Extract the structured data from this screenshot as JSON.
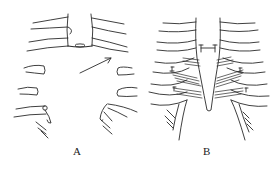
{
  "figure": {
    "panels": [
      {
        "label": "A",
        "content": "Divided sternum and rib ends with arrow indicating direction of correction"
      },
      {
        "label": "B",
        "content": "Reconstructed chest wall with sutured sternum and fixed rib cartilages"
      }
    ],
    "line_color": "#2a2a2a",
    "background": "#ffffff"
  }
}
